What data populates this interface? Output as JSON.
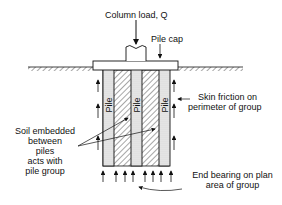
{
  "labels": {
    "column_load": "Column load, Q",
    "pile_cap": "Pile cap",
    "pile": "Pile",
    "skin_friction_1": "Skin friction on",
    "skin_friction_2": "perimeter of group",
    "soil_1": "Soil embedded",
    "soil_2": "between",
    "soil_3": "piles",
    "soil_4": "acts with",
    "soil_5": "pile group",
    "end_bearing_1": "End bearing on plan",
    "end_bearing_2": "area of group"
  }
}
